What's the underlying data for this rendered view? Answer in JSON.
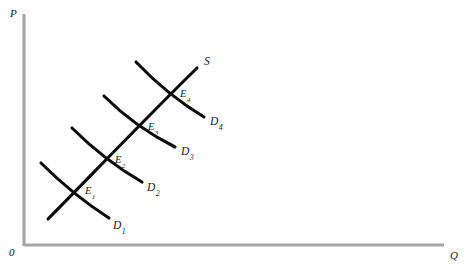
{
  "figure": {
    "title_visible": false,
    "background_color": "#ffffff",
    "axis_color": "#a6a6a6",
    "curve_color": "#0b0b0b"
  },
  "axes": {
    "vertical": {
      "label": "P",
      "name": "price-axis",
      "x": 24,
      "y_top": 14,
      "y_bottom": 246,
      "label_x": 10,
      "label_y": 8
    },
    "horizontal": {
      "label": "Q",
      "name": "quantity-axis",
      "y": 245,
      "x_left": 24,
      "x_right": 444,
      "label_x": 450,
      "label_y": 250
    },
    "origin": {
      "label": "0",
      "x": 9,
      "y": 247
    }
  },
  "supply": {
    "label": "S",
    "label_x": 204,
    "label_y": 56,
    "path": "M 48 219 C 86 181, 130 134, 197 68"
  },
  "demand_curves": [
    {
      "label": "D",
      "subscript": "1",
      "label_x": 113,
      "label_y": 220,
      "path": "M 41 163 C 60 182, 84 202, 109 218"
    },
    {
      "label": "D",
      "subscript": "2",
      "label_x": 147,
      "label_y": 182,
      "path": "M 72 128 C 92 148, 116 167, 142 182"
    },
    {
      "label": "D",
      "subscript": "3",
      "label_x": 181,
      "label_y": 146,
      "path": "M 104 96 C 124 116, 149 134, 175 147"
    },
    {
      "label": "D",
      "subscript": "4",
      "label_x": 210,
      "label_y": 116,
      "path": "M 136 62 C 156 83, 179 102, 204 117"
    }
  ],
  "equilibria": [
    {
      "label": "E",
      "subscript": "1",
      "x": 76,
      "y": 192,
      "label_x": 85,
      "label_y": 186
    },
    {
      "label": "E",
      "subscript": "2",
      "x": 106,
      "y": 161,
      "label_x": 115,
      "label_y": 155
    },
    {
      "label": "E",
      "subscript": "3",
      "x": 139,
      "y": 128,
      "label_x": 148,
      "label_y": 122
    },
    {
      "label": "E",
      "subscript": "4",
      "x": 171,
      "y": 95,
      "label_x": 180,
      "label_y": 89
    }
  ],
  "chart_data": {
    "type": "line",
    "title": "",
    "xlabel": "Q",
    "ylabel": "P",
    "grid": false,
    "legend": "none",
    "series": [
      {
        "name": "S",
        "kind": "supply"
      },
      {
        "name": "D1",
        "kind": "demand"
      },
      {
        "name": "D2",
        "kind": "demand"
      },
      {
        "name": "D3",
        "kind": "demand"
      },
      {
        "name": "D4",
        "kind": "demand"
      }
    ],
    "equilibrium_points": [
      {
        "name": "E1",
        "q": 76,
        "p": 192
      },
      {
        "name": "E2",
        "q": 106,
        "p": 161
      },
      {
        "name": "E3",
        "q": 139,
        "p": 128
      },
      {
        "name": "E4",
        "q": 171,
        "p": 95
      }
    ]
  }
}
